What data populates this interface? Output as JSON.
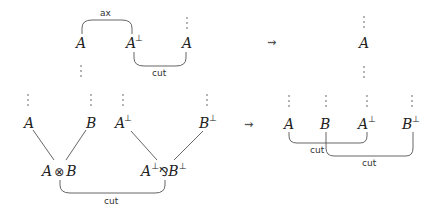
{
  "top": {
    "left": {
      "formulas": [
        {
          "id": "A1",
          "base": "A",
          "sup": "",
          "x": 80,
          "y": 48
        },
        {
          "id": "A2",
          "base": "A",
          "sup": "⊥",
          "x": 128,
          "y": 48
        },
        {
          "id": "A3",
          "base": "A",
          "sup": "",
          "x": 183,
          "y": 48
        }
      ],
      "axiom_label": "ax",
      "cut_label": "cut"
    },
    "arrow": "⇝",
    "right": {
      "formula": {
        "base": "A",
        "sup": ""
      }
    }
  },
  "bottom": {
    "left": {
      "premises": [
        {
          "base": "A",
          "sup": ""
        },
        {
          "base": "B",
          "sup": ""
        },
        {
          "base": "A",
          "sup": "⊥"
        },
        {
          "base": "B",
          "sup": "⊥"
        }
      ],
      "tensor": {
        "left": "A",
        "op": "⊗",
        "right": "B"
      },
      "par": {
        "left": "A",
        "left_sup": "⊥",
        "op": "⅋",
        "right": "B",
        "right_sup": "⊥"
      },
      "cut_label": "cut"
    },
    "arrow": "⇝",
    "right": {
      "formulas": [
        {
          "base": "A",
          "sup": ""
        },
        {
          "base": "B",
          "sup": ""
        },
        {
          "base": "A",
          "sup": "⊥"
        },
        {
          "base": "B",
          "sup": "⊥"
        }
      ],
      "cut_labels": [
        "cut",
        "cut"
      ]
    }
  },
  "vdots": "⋮"
}
